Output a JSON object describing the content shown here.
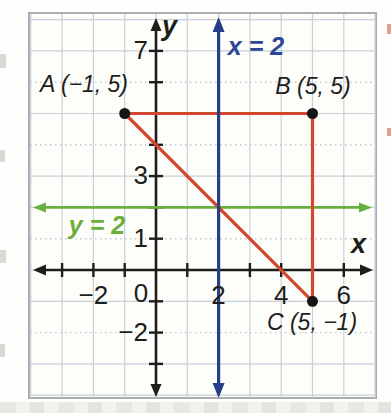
{
  "figure": {
    "grid_color": "#c7d0d9",
    "grid_dotted_color": "#bfc9d3",
    "axis_color": "#1d1d1b",
    "dot_color": "#151515",
    "plot_background": "#fdfdfa",
    "frame_color": "#a9aeb2"
  },
  "chart_data": {
    "type": "line",
    "title": "",
    "xlim": [
      -4,
      7
    ],
    "ylim": [
      -4,
      8
    ],
    "grid": true,
    "grid_step": 1,
    "grid_dotted_y": [
      6,
      4,
      1,
      -2
    ],
    "axes": {
      "x": {
        "label": "x",
        "ticks": [
          {
            "v": -2,
            "t": "−2"
          },
          {
            "v": 0,
            "t": "0"
          },
          {
            "v": 2,
            "t": "2"
          },
          {
            "v": 4,
            "t": "4"
          },
          {
            "v": 6,
            "t": "6"
          }
        ]
      },
      "y": {
        "label": "y",
        "ticks": [
          {
            "v": 7,
            "t": "7"
          },
          {
            "v": 3,
            "t": "3"
          },
          {
            "v": 1,
            "t": "1"
          },
          {
            "v": -2,
            "t": "−2"
          }
        ]
      }
    },
    "points": [
      {
        "name": "A",
        "x": -1,
        "y": 5,
        "label": "A (−1, 5)"
      },
      {
        "name": "B",
        "x": 5,
        "y": 5,
        "label": "B (5, 5)"
      },
      {
        "name": "C",
        "x": 5,
        "y": -1,
        "label": "C (5, −1)"
      }
    ],
    "triangle": {
      "vertices": [
        [
          -1,
          5
        ],
        [
          5,
          5
        ],
        [
          5,
          -1
        ]
      ],
      "color": "#d2472e",
      "fill": "none"
    },
    "lines": [
      {
        "equation": "x = 2",
        "orientation": "vertical",
        "value": 2,
        "color": "#263f8a",
        "label_color": "#2c4795"
      },
      {
        "equation": "y = 2",
        "orientation": "horizontal",
        "value": 2,
        "color": "#68b03e",
        "label_color": "#6aae3d"
      }
    ]
  }
}
